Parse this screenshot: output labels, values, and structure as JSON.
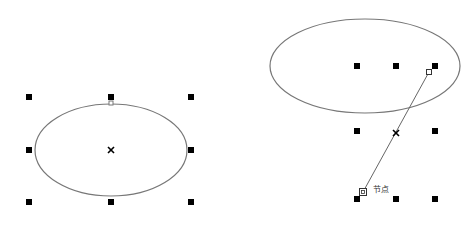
{
  "colors": {
    "background": "#ffffff",
    "outline": "#777777",
    "handle": "#000000",
    "line": "#666666"
  },
  "left_panel": {
    "ellipse": {
      "cx": 111,
      "cy": 150,
      "rx": 76,
      "ry": 46
    },
    "handles": [
      {
        "x": 29,
        "y": 97
      },
      {
        "x": 111,
        "y": 97
      },
      {
        "x": 191,
        "y": 97
      },
      {
        "x": 29,
        "y": 150
      },
      {
        "x": 191,
        "y": 150
      },
      {
        "x": 29,
        "y": 202
      },
      {
        "x": 111,
        "y": 202
      },
      {
        "x": 191,
        "y": 202
      }
    ],
    "center_marker": {
      "x": 111,
      "y": 150,
      "glyph": "×"
    },
    "start_node": {
      "x": 111,
      "y": 103
    }
  },
  "right_panel": {
    "ellipse": {
      "cx": 365,
      "cy": 66,
      "rx": 95,
      "ry": 47
    },
    "handles": [
      {
        "x": 357,
        "y": 66
      },
      {
        "x": 396,
        "y": 66
      },
      {
        "x": 435,
        "y": 66
      },
      {
        "x": 357,
        "y": 131
      },
      {
        "x": 435,
        "y": 131
      },
      {
        "x": 357,
        "y": 199
      },
      {
        "x": 396,
        "y": 199
      },
      {
        "x": 435,
        "y": 199
      }
    ],
    "center_marker": {
      "x": 396,
      "y": 133,
      "glyph": "×"
    },
    "node_on_ellipse": {
      "x": 429,
      "y": 72
    },
    "drag_line": {
      "x1": 429,
      "y1": 72,
      "x2": 363,
      "y2": 192
    },
    "cursor_node": {
      "x": 363,
      "y": 192
    },
    "cursor_label": "节点"
  }
}
